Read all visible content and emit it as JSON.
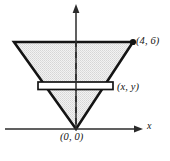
{
  "figure": {
    "background_color": "#ffffff",
    "stroke_color": "#141414",
    "fill_color": "#e8e8e8",
    "slice_fill_color": "#ffffff",
    "width": 170,
    "height": 161,
    "axes": {
      "x_axis": {
        "label": "x",
        "name": "x-axis",
        "italic": true,
        "arrow": "right",
        "y_pixel": 129,
        "x_start_pixel": 5,
        "x_end_pixel": 142
      },
      "y_axis": {
        "label": "",
        "name": "y-axis",
        "arrow": "up",
        "x_pixel": 76,
        "y_top_pixel": 5,
        "y_bottom_pixel": 129
      }
    },
    "labels": {
      "top_right_vertex": "(4, 6)",
      "slice_point": "(x, y)",
      "origin_vertex": "(0, 0)",
      "x_axis_name": "x"
    },
    "shape": {
      "type": "triangle",
      "description": "inverted triangle apex at origin",
      "vertices_pixels": [
        [
          14,
          42
        ],
        [
          133,
          42
        ],
        [
          76,
          129
        ]
      ],
      "vertices_math": [
        [
          "-4",
          "6"
        ],
        [
          "4",
          "6"
        ],
        [
          "0",
          "0"
        ]
      ]
    },
    "slice": {
      "type": "rectangle",
      "description": "representative horizontal strip element",
      "left_pixel": 38,
      "right_pixel": 113,
      "top_pixel": 82,
      "bottom_pixel": 89
    },
    "center_line": {
      "type": "dashed",
      "x_pixel": 76,
      "y_top_pixel": 42,
      "y_bottom_pixel": 129
    },
    "markers": [
      {
        "name": "vertex-dot",
        "x_pixel": 133,
        "y_pixel": 42,
        "radius": 3
      }
    ]
  }
}
